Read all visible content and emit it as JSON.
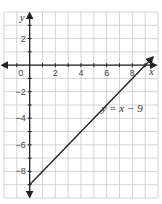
{
  "chart_data": {
    "type": "line",
    "title": "",
    "xlabel": "x",
    "ylabel": "y",
    "xlim": [
      -2,
      10
    ],
    "ylim": [
      -10,
      4
    ],
    "grid": true,
    "x_ticks": [
      0,
      2,
      4,
      6,
      8
    ],
    "x_tick_labels": [
      "0",
      "2",
      "4",
      "6",
      "8"
    ],
    "y_ticks": [
      2,
      -2,
      -4,
      -6,
      -8
    ],
    "y_tick_labels": [
      "2",
      "−2",
      "−4",
      "−6",
      "−8"
    ],
    "series": [
      {
        "name": "y = x − 9",
        "equation": "y = x - 9",
        "slope": 1,
        "intercept": -9,
        "x": [
          0,
          9.6
        ],
        "y": [
          -9,
          0.6
        ]
      }
    ],
    "annotations": [
      {
        "text": "y = x − 9",
        "x": 5.6,
        "y": -3.5
      }
    ],
    "colors": {
      "grid": "#c8c8c8",
      "axis": "#222222",
      "line": "#222222"
    }
  },
  "labels": {
    "x_axis": "x",
    "y_axis": "y",
    "equation": "y = x − 9",
    "origin": "0"
  }
}
